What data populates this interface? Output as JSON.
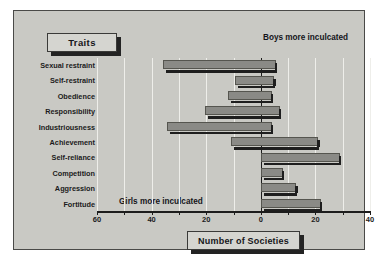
{
  "legend_box": {
    "label": "Traits"
  },
  "axis_title_box": {
    "label": "Number of Societies"
  },
  "annotations": {
    "right": "Boys more inculcated",
    "left": "Girls more inculcated"
  },
  "chart_data": {
    "type": "bar",
    "orientation": "horizontal",
    "title": "",
    "subtitle": "",
    "xlabel": "Number of Societies",
    "ylabel": "Traits",
    "grid": true,
    "legend_position": "none",
    "diverging": true,
    "xlim": [
      -60,
      40
    ],
    "xticks": [
      -60,
      -40,
      -20,
      0,
      20,
      40
    ],
    "xtick_labels": [
      "60",
      "40",
      "20",
      "0",
      "20",
      "40"
    ],
    "axis_note_left": "Girls more inculcated",
    "axis_note_right": "Boys more inculcated",
    "bar_color": "#8a8a86",
    "categories": [
      "Sexual restraint",
      "Self-restraint",
      "Obedience",
      "Responsibility",
      "Industriousness",
      "Achievement",
      "Self-reliance",
      "Competition",
      "Aggression",
      "Fortitude"
    ],
    "series": [
      {
        "name": "Girls more inculcated",
        "direction": "left",
        "values": [
          36,
          9.5,
          12,
          20.5,
          34.5,
          11,
          0,
          0,
          0,
          0
        ]
      },
      {
        "name": "Boys more inculcated",
        "direction": "right",
        "values": [
          5.5,
          5,
          4,
          7,
          4,
          21,
          29,
          8,
          13,
          22
        ]
      }
    ]
  }
}
